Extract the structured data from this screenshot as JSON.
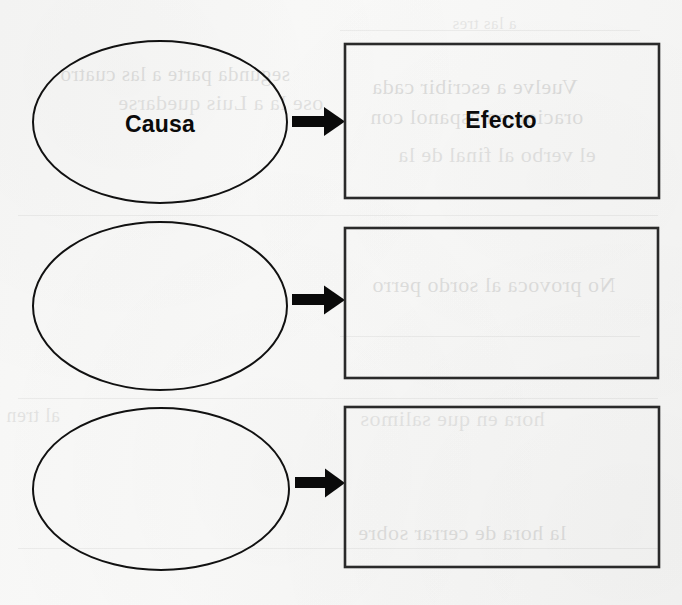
{
  "document": {
    "title": "Causa y Efecto",
    "kind": "graphic-organizer-worksheet",
    "language": "es",
    "background_color": "#f8f8f7",
    "ink_color": "#111111"
  },
  "labels": {
    "cause_heading": "Causa",
    "effect_heading": "Efecto"
  },
  "rows": [
    {
      "index": 1,
      "cause_text": "Causa",
      "effect_text": "Efecto",
      "arrow": "right-arrow-icon"
    },
    {
      "index": 2,
      "cause_text": "",
      "effect_text": "",
      "arrow": "right-arrow-icon"
    },
    {
      "index": 3,
      "cause_text": "",
      "effect_text": "",
      "arrow": "right-arrow-icon"
    }
  ],
  "geometry": {
    "canvas": {
      "width": 682,
      "height": 605
    },
    "ovals": [
      {
        "cx": 160,
        "cy": 122,
        "rx": 127,
        "ry": 81
      },
      {
        "cx": 160,
        "cy": 306,
        "rx": 127,
        "ry": 84
      },
      {
        "cx": 161,
        "cy": 489,
        "rx": 128,
        "ry": 81
      }
    ],
    "rects": [
      {
        "x": 345,
        "y": 44,
        "w": 314,
        "h": 154
      },
      {
        "x": 345,
        "y": 228,
        "w": 313,
        "h": 150
      },
      {
        "x": 345,
        "y": 407,
        "w": 314,
        "h": 160
      }
    ],
    "arrows": [
      {
        "x1": 292,
        "x2": 345,
        "y": 121,
        "shaft": 10,
        "head": 20
      },
      {
        "x1": 292,
        "x2": 345,
        "y": 300,
        "shaft": 10,
        "head": 20
      },
      {
        "x1": 295,
        "x2": 345,
        "y": 483,
        "shaft": 10,
        "head": 20
      }
    ],
    "label_positions": {
      "causa": {
        "x": 160,
        "y": 124
      },
      "efecto": {
        "x": 501,
        "y": 120
      }
    }
  },
  "bleed_through": {
    "description": "faint mirrored show-through text from the reverse side of the scanned page",
    "fragments": [
      {
        "text": "segunda parte a las cuatro",
        "x": 60,
        "y": 62,
        "size": 21,
        "opacity": 0.1
      },
      {
        "text": "ose la a Luis quedarse",
        "x": 118,
        "y": 90,
        "size": 22,
        "opacity": 0.09
      },
      {
        "text": "a las tres",
        "x": 452,
        "y": 14,
        "size": 17,
        "opacity": 0.07
      },
      {
        "text": "Vuelve a escribir cada",
        "x": 372,
        "y": 74,
        "size": 22,
        "opacity": 0.11
      },
      {
        "text": "oracion en espanol con",
        "x": 370,
        "y": 104,
        "size": 22,
        "opacity": 0.1
      },
      {
        "text": "el verbo al final de la",
        "x": 398,
        "y": 142,
        "size": 22,
        "opacity": 0.09
      },
      {
        "text": "No provoca al sordo perro",
        "x": 372,
        "y": 272,
        "size": 22,
        "opacity": 0.1
      },
      {
        "text": "hora en que salimos",
        "x": 360,
        "y": 406,
        "size": 22,
        "opacity": 0.08
      },
      {
        "text": "la hora de cerrar sobre",
        "x": 358,
        "y": 520,
        "size": 22,
        "opacity": 0.1
      },
      {
        "text": "al tren",
        "x": 6,
        "y": 404,
        "size": 20,
        "opacity": 0.08
      }
    ]
  }
}
